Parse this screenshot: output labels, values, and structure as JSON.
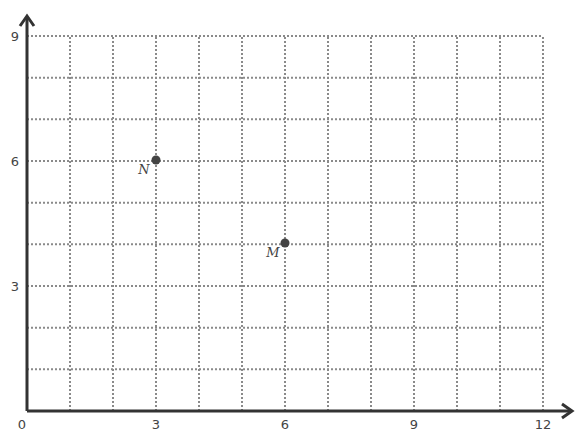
{
  "chart_data": {
    "type": "scatter",
    "title": "",
    "xlabel": "",
    "ylabel": "",
    "xlim": [
      0,
      12
    ],
    "ylim": [
      0,
      9
    ],
    "grid": true,
    "grid_step": 1,
    "x_ticks": [
      "0",
      "3",
      "6",
      "9",
      "12"
    ],
    "y_ticks": [
      "3",
      "6",
      "9"
    ],
    "points": [
      {
        "label": "N",
        "x": 3,
        "y": 6
      },
      {
        "label": "M",
        "x": 6,
        "y": 4
      }
    ]
  },
  "labels": {
    "origin": "0",
    "x3": "3",
    "x6": "6",
    "x9": "9",
    "x12": "12",
    "y3": "3",
    "y6": "6",
    "y9": "9",
    "pointN": "N",
    "pointM": "M"
  },
  "colors": {
    "axis": "#333333",
    "grid": "#8a8a8a",
    "point": "#444444"
  }
}
